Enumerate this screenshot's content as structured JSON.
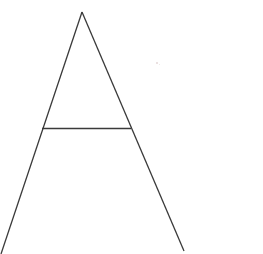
{
  "canvas": {
    "width": 263,
    "height": 254,
    "background_color": "#ffffff",
    "description": "Hand-drawn style line figure of the capital letter A on a plain white background"
  },
  "figure": {
    "name": "letter-a-glyph",
    "label": "A",
    "stroke_color": "#3a3a3a",
    "stroke_width": 1.3,
    "strokes": [
      {
        "id": "left-leg",
        "name": "left-diagonal-stroke",
        "x1": 82,
        "y1": 12,
        "x2": 1,
        "y2": 254
      },
      {
        "id": "right-leg",
        "name": "right-diagonal-stroke",
        "x1": 82,
        "y1": 12,
        "x2": 184,
        "y2": 251
      },
      {
        "id": "crossbar",
        "name": "horizontal-crossbar-stroke",
        "x1": 42,
        "y1": 128.5,
        "x2": 131,
        "y2": 128.5
      }
    ],
    "vertices": {
      "apex": {
        "x": 82,
        "y": 12
      },
      "left_foot": {
        "x": 1,
        "y": 254
      },
      "right_foot": {
        "x": 184,
        "y": 251
      },
      "crossbar_left": {
        "x": 42,
        "y": 128
      },
      "crossbar_right": {
        "x": 131,
        "y": 128
      }
    }
  },
  "artifacts": [
    {
      "id": "speck-1",
      "name": "scan-speck",
      "x": 156,
      "y": 62,
      "size": 1.5,
      "color": "#e8dcdc"
    },
    {
      "id": "speck-2",
      "name": "scan-speck",
      "x": 159,
      "y": 64,
      "size": 1.2,
      "color": "#ece2e2"
    }
  ]
}
